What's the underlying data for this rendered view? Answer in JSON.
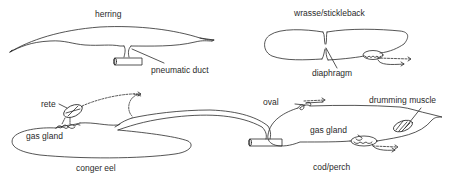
{
  "diagram": {
    "panels": [
      {
        "id": "herring",
        "title": "herring",
        "labels": [
          "pneumatic duct"
        ]
      },
      {
        "id": "wrasse",
        "title": "wrasse/stickleback",
        "labels": [
          "diaphragm"
        ]
      },
      {
        "id": "conger",
        "title": "conger eel",
        "labels": [
          "rete",
          "gas gland"
        ]
      },
      {
        "id": "cod",
        "title": "cod/perch",
        "labels": [
          "oval",
          "drumming muscle",
          "gas gland"
        ]
      }
    ]
  },
  "herring": {
    "title": "herring",
    "duct_label": "pneumatic duct"
  },
  "wrasse": {
    "title": "wrasse/stickleback",
    "diaphragm_label": "diaphragm"
  },
  "conger": {
    "title": "conger eel",
    "rete_label": "rete",
    "gas_gland_label": "gas gland"
  },
  "cod": {
    "title": "cod/perch",
    "oval_label": "oval",
    "drumming_label": "drumming muscle",
    "gas_gland_label": "gas gland"
  },
  "colors": {
    "line": "#2a2a2a",
    "background": "#ffffff"
  }
}
